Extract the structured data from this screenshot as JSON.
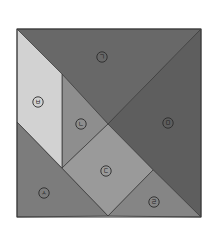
{
  "diagram": {
    "type": "tangram-square",
    "outline": {
      "x": 17,
      "y": 29,
      "width": 184,
      "height": 188
    },
    "pieces": [
      {
        "id": "giyeok",
        "label": "ㄱ",
        "shape": "large-triangle",
        "color": "#686868",
        "points": "17,29 201,29 108,124",
        "label_pos": [
          102,
          57
        ]
      },
      {
        "id": "mieum",
        "label": "ㅁ",
        "shape": "large-triangle",
        "color": "#5e5e5e",
        "points": "201,29 201,217 108,124",
        "label_pos": [
          168,
          123
        ]
      },
      {
        "id": "nieun",
        "label": "ㄴ",
        "shape": "small-triangle",
        "color": "#8e8e8e",
        "points": "62,74 108,124 62,168",
        "label_pos": [
          81,
          124
        ]
      },
      {
        "id": "digeut",
        "label": "ㄷ",
        "shape": "square",
        "color": "#9a9a9a",
        "points": "108,124 153,170 108,216 62,168",
        "label_pos": [
          106,
          171
        ]
      },
      {
        "id": "rieul",
        "label": "ㄹ",
        "shape": "small-triangle",
        "color": "#858585",
        "points": "153,170 201,217 108,216",
        "label_pos": [
          154,
          202
        ]
      },
      {
        "id": "bieup",
        "label": "ㅂ",
        "shape": "parallelogram",
        "color": "#d2d2d2",
        "points": "17,29 62,74 62,168 17,122",
        "label_pos": [
          38,
          102
        ]
      },
      {
        "id": "siot",
        "label": "ㅅ",
        "shape": "medium-triangle",
        "color": "#7c7c7c",
        "points": "17,122 108,216 17,217",
        "label_pos": [
          44,
          193
        ]
      }
    ]
  }
}
